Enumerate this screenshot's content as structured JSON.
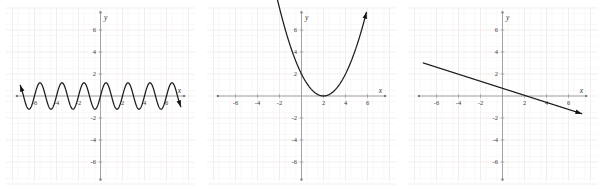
{
  "figure": {
    "panel_count": 3,
    "background_color": "#ffffff",
    "grid_color": "#f0e9ea",
    "axis_color": "#9a9a9a",
    "curve_color": "#1c1c1c"
  },
  "chart_data": [
    {
      "id": "graph-sine",
      "type": "line",
      "title": "",
      "xlabel": "x",
      "ylabel": "y",
      "xlim": [
        -7.6,
        7.6
      ],
      "ylim": [
        -7.6,
        7.6
      ],
      "xticks": [
        -6,
        -4,
        -2,
        2,
        4,
        6
      ],
      "yticks": [
        -6,
        -4,
        -2,
        2,
        4,
        6
      ],
      "xtick_labels": [
        "-6",
        "-4",
        "-2",
        "2",
        "4",
        "6"
      ],
      "ytick_labels": [
        "-6",
        "-4",
        "-2",
        "2",
        "4",
        "6"
      ],
      "grid": true,
      "legend": "none",
      "series": [
        {
          "name": "sinusoid",
          "equation": "y = 1.2 sin(pi x)",
          "amplitude": 1.2,
          "period": 2,
          "x_start": -7.3,
          "x_end": 7.3,
          "arrow_left": true,
          "arrow_right": true
        }
      ]
    },
    {
      "id": "graph-parabola",
      "type": "line",
      "title": "",
      "xlabel": "x",
      "ylabel": "y",
      "xlim": [
        -7.6,
        7.6
      ],
      "ylim": [
        -7.6,
        7.6
      ],
      "xticks": [
        -6,
        -4,
        -2,
        2,
        4,
        6
      ],
      "yticks": [
        -6,
        -4,
        -2,
        2,
        4,
        6
      ],
      "xtick_labels": [
        "-6",
        "-4",
        "-2",
        "2",
        "4",
        "6"
      ],
      "ytick_labels": [
        "-6",
        "-4",
        "-2",
        "2",
        "4",
        "6"
      ],
      "grid": true,
      "legend": "none",
      "series": [
        {
          "name": "parabola",
          "equation": "y = 0.5 (x - 2)^2",
          "vertex_x": 2,
          "vertex_y": 0,
          "a": 0.5,
          "y_at_x0": 2,
          "x_start": -2.4,
          "x_end": 5.9,
          "arrow_left": true,
          "arrow_right": true
        }
      ]
    },
    {
      "id": "graph-line",
      "type": "line",
      "title": "",
      "xlabel": "x",
      "ylabel": "y",
      "xlim": [
        -7.6,
        7.6
      ],
      "ylim": [
        -7.6,
        7.6
      ],
      "xticks": [
        -6,
        -4,
        -2,
        2,
        4,
        6
      ],
      "yticks": [
        -6,
        -4,
        -2,
        2,
        4,
        6
      ],
      "xtick_labels": [
        "-6",
        "-4",
        "-2",
        "2",
        "4",
        "6"
      ],
      "ytick_labels": [
        "-6",
        "-4",
        "-2",
        "2",
        "4",
        "6"
      ],
      "grid": true,
      "legend": "none",
      "series": [
        {
          "name": "decreasing-line",
          "equation": "y = -0.32 x + 0.7",
          "slope": -0.32,
          "intercept": 0.7,
          "x_intercept": 2.2,
          "x_start": -7.2,
          "x_end": 7.2,
          "arrow_left": false,
          "arrow_right": true
        }
      ]
    }
  ]
}
